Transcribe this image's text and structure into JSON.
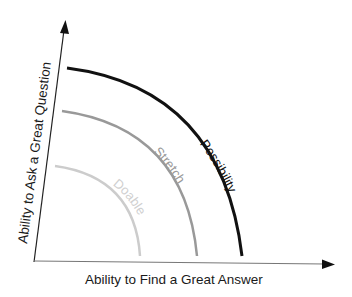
{
  "diagram": {
    "x_axis": {
      "label": "Ability to Find a Great Answer"
    },
    "y_axis": {
      "label": "Ability to Ask a Great Question"
    },
    "arcs": [
      {
        "label": "Possibility",
        "color": "#111111",
        "stroke_width": 3
      },
      {
        "label": "Stretch",
        "color": "#999999",
        "stroke_width": 2.5
      },
      {
        "label": "Doable",
        "color": "#cccccc",
        "stroke_width": 2.5
      }
    ]
  }
}
